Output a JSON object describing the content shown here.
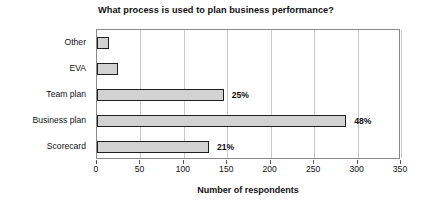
{
  "chart_data": {
    "type": "bar",
    "orientation": "horizontal",
    "title": "What process is used to plan business performance?",
    "xlabel": "Number of respondents",
    "ylabel": "",
    "xlim": [
      0,
      350
    ],
    "xticks": [
      0,
      50,
      100,
      150,
      200,
      250,
      300,
      350
    ],
    "grid": true,
    "legend": false,
    "categories": [
      "Other",
      "EVA",
      "Team plan",
      "Business plan",
      "Scorecard"
    ],
    "values": [
      14,
      24,
      146,
      287,
      129
    ],
    "data_labels": [
      "",
      "",
      "25%",
      "48%",
      "21%"
    ],
    "bar_fill_color": "#d2d2d2",
    "bar_border_color": "#1f1f1f",
    "grid_color": "#c8c8c8",
    "plot_border_color": "#8a8a8a",
    "series": [
      {
        "name": "Number of respondents",
        "points": [
          {
            "category": "Other",
            "value": 14,
            "label": ""
          },
          {
            "category": "EVA",
            "value": 24,
            "label": ""
          },
          {
            "category": "Team plan",
            "value": 146,
            "label": "25%"
          },
          {
            "category": "Business plan",
            "value": 287,
            "label": "48%"
          },
          {
            "category": "Scorecard",
            "value": 129,
            "label": "21%"
          }
        ]
      }
    ]
  }
}
